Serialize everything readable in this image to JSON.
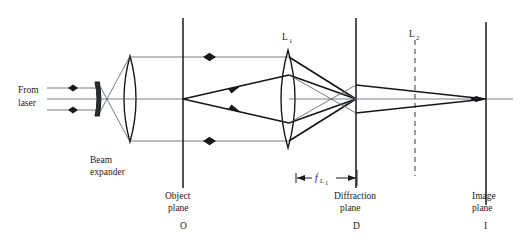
{
  "figure": {
    "kind": "optical-ray-diagram",
    "width": 527,
    "height": 240,
    "background": "#ffffff",
    "ink": "#17191c",
    "thin_ray_color": "#555a5e",
    "dashed_color": "#6c7176"
  },
  "labels": {
    "source_line1": "From",
    "source_line2": "laser",
    "beam_expander_line1": "Beam",
    "beam_expander_line2": "expander",
    "lens1": "L",
    "lens1_sub": "1",
    "lens2": "L",
    "lens2_sub": "2",
    "object_plane_line1": "Object",
    "object_plane_line2": "plane",
    "object_plane_letter": "O",
    "diffraction_plane_line1": "Diffraction",
    "diffraction_plane_line2": "plane",
    "diffraction_plane_letter": "D",
    "image_plane_line1": "Image",
    "image_plane_line2": "plane",
    "image_plane_letter": "I",
    "focal_length_symbol": "f",
    "focal_length_sub": "L",
    "focal_length_sub2": "1"
  },
  "elements": {
    "object_plane_x": 183,
    "diffraction_plane_x": 356,
    "lens2_plane_x": 415,
    "image_plane_x": 486,
    "lens1_center_x": 288,
    "beam_expander_concave_x": 99,
    "beam_expander_convex_x": 130,
    "optical_axis_y": 99
  },
  "dimension": {
    "from_x": 295,
    "to_x": 356,
    "label": "f L1",
    "y": 178
  }
}
